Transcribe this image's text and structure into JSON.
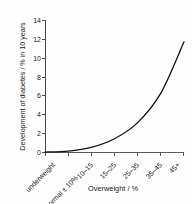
{
  "chart_data": {
    "type": "line",
    "title": "",
    "xlabel": "Overweight / %",
    "ylabel": "Development of diabetes / % in 10 years",
    "categories": [
      "underweight",
      "normal ± 10%",
      "10–15",
      "15–25",
      "25–35",
      "35–45",
      "45+"
    ],
    "values": [
      0.1,
      0.2,
      0.6,
      1.5,
      3.2,
      6.3,
      11.7
    ],
    "series": [
      {
        "name": "Development of diabetes",
        "values": [
          0.1,
          0.2,
          0.6,
          1.5,
          3.2,
          6.3,
          11.7
        ]
      }
    ],
    "yticks": [
      "0",
      "2",
      "4",
      "6",
      "8",
      "10",
      "12",
      "14"
    ],
    "ytick_values": [
      0,
      2,
      4,
      6,
      8,
      10,
      12,
      14
    ],
    "ylim": [
      0,
      14
    ],
    "xlim": [
      0,
      6
    ],
    "grid": false,
    "legend": false,
    "line_color": "#111111",
    "background_color": "#ffffff"
  },
  "axes": {
    "y_title": "Development of diabetes / % in 10 years",
    "x_title": "Overweight / %"
  }
}
